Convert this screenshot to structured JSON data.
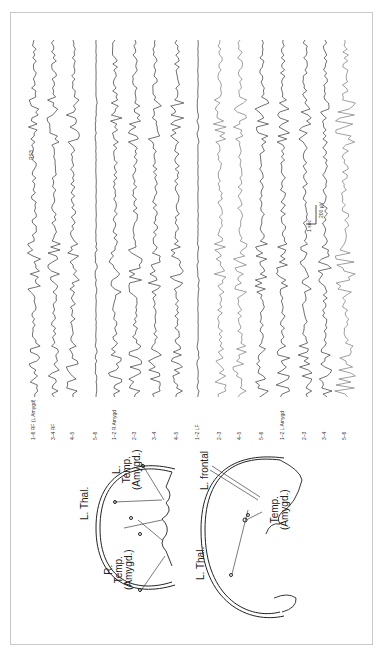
{
  "figure": {
    "orientation": "rotated-90-ccw",
    "eeg": {
      "annotation": "RS3",
      "scale_bar": {
        "amplitude": "200 µV",
        "time": "1 sec"
      },
      "channels": [
        {
          "label": "1–6",
          "electrode": "RF (L Amygd)"
        },
        {
          "label": "3–4",
          "electrode": "RF"
        },
        {
          "label": "4–5",
          "electrode": ""
        },
        {
          "label": "5–6",
          "electrode": ""
        },
        {
          "label": "1–2",
          "electrode": "R Amygd"
        },
        {
          "label": "2–3",
          "electrode": ""
        },
        {
          "label": "3–4",
          "electrode": ""
        },
        {
          "label": "4–5",
          "electrode": ""
        },
        {
          "label": "1–2",
          "electrode": "LF"
        },
        {
          "label": "2–3",
          "electrode": ""
        },
        {
          "label": "4–5",
          "electrode": ""
        },
        {
          "label": "5–6",
          "electrode": ""
        },
        {
          "label": "1–2",
          "electrode": "L Amygd"
        },
        {
          "label": "2–3",
          "electrode": ""
        },
        {
          "label": "3–4",
          "electrode": ""
        },
        {
          "label": "5–6",
          "electrode": ""
        }
      ]
    },
    "diagram_axial": {
      "labels": {
        "l_thal": "L. Thal.",
        "l_temp": [
          "L.",
          "Temp.",
          "(Amygd.)"
        ],
        "r_temp": [
          "R.",
          "Temp.",
          "(Amygd.)"
        ]
      }
    },
    "diagram_sagittal": {
      "labels": {
        "l_frontal": "L. frontal",
        "temp": [
          "Temp.",
          "(Amygd.)"
        ],
        "l_thal": "L. Thal."
      }
    }
  }
}
